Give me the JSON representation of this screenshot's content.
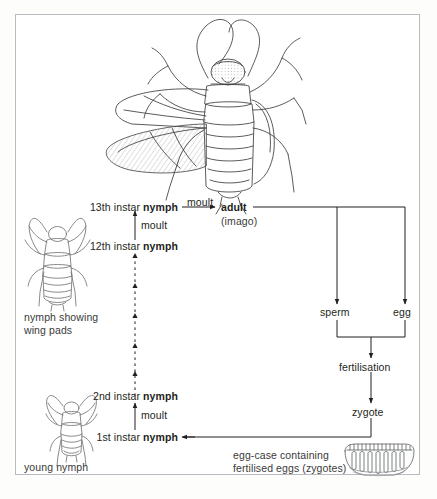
{
  "figure": {
    "background_color": "#ffffff",
    "frame_color": "#b9bcbe",
    "ink_color": "#231f20"
  },
  "illustrations": {
    "adult": {
      "name": "adult-cockroach-drawing",
      "caption": ""
    },
    "older_nymph": {
      "name": "nymph-wing-pads-drawing",
      "caption_line1": "nymph showing",
      "caption_line2": "wing pads"
    },
    "young_nymph": {
      "name": "young-nymph-drawing",
      "caption": "young nymph"
    },
    "egg_case": {
      "name": "egg-case-ootheca-drawing",
      "caption_line1": "egg-case containing",
      "caption_line2": "fertilised eggs (zygotes)"
    }
  },
  "stages": {
    "instar13": {
      "prefix": "13th instar ",
      "bold": "nymph"
    },
    "instar12": {
      "prefix": "12th instar ",
      "bold": "nymph"
    },
    "instar2": {
      "prefix": "2nd instar ",
      "bold": "nymph"
    },
    "instar1": {
      "prefix": "1st instar ",
      "bold": "nymph"
    },
    "adult": {
      "bold": "adult",
      "sub": "(imago)"
    },
    "sperm": {
      "label": "sperm"
    },
    "egg": {
      "label": "egg"
    },
    "fertilisation": {
      "label": "fertilisation"
    },
    "zygote": {
      "label": "zygote"
    }
  },
  "transitions": {
    "moult_12_to_13": "moult",
    "moult_nymph_to_adult": "moult",
    "moult_1_to_2": "moult",
    "intermediate_moults": "dashed repeated moults"
  }
}
